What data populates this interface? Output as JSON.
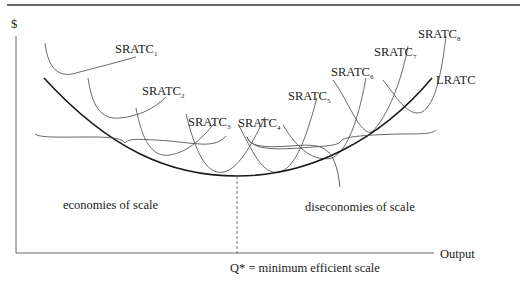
{
  "diagram": {
    "type": "economics-cost-curves",
    "y_axis_label": "$",
    "x_axis_label": "Output",
    "long_run_curve_label": "LRATC",
    "short_run_curves": [
      {
        "name": "SRATC",
        "sub": "1"
      },
      {
        "name": "SRATC",
        "sub": "2"
      },
      {
        "name": "SRATC",
        "sub": "3"
      },
      {
        "name": "SRATC",
        "sub": "4"
      },
      {
        "name": "SRATC",
        "sub": "5"
      },
      {
        "name": "SRATC",
        "sub": "6"
      },
      {
        "name": "SRATC",
        "sub": "7"
      },
      {
        "name": "SRATC",
        "sub": "8"
      }
    ],
    "region_left_label": "economies of scale",
    "region_right_label": "diseconomies of scale",
    "min_point_label": "Q* = minimum efficient scale",
    "colors": {
      "axis": "#444444",
      "lrac": "#1a1a1a",
      "srac": "#666666",
      "text": "#222222",
      "rule": "#333333"
    }
  }
}
